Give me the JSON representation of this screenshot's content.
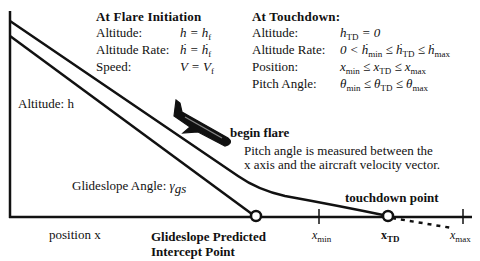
{
  "flare_initiation": {
    "title": "At Flare Initiation",
    "rows": [
      {
        "label": "Altitude:",
        "expr": "h = h",
        "sub": "f"
      },
      {
        "label": "Altitude Rate:",
        "expr": "ḣ = ḣ",
        "sub": "f"
      },
      {
        "label": "Speed:",
        "expr": "V = V",
        "sub": "f"
      }
    ]
  },
  "touchdown": {
    "title": "At Touchdown:",
    "rows": [
      {
        "label": "Altitude:",
        "expr": "h_TD = 0"
      },
      {
        "label": "Altitude Rate:",
        "expr": "0 < ḣ_min ≤ ḣ_TD ≤ ḣ_max"
      },
      {
        "label": "Position:",
        "expr": "x_min ≤ x_TD ≤ x_max"
      },
      {
        "label": "Pitch Angle:",
        "expr": "θ_min ≤ θ_TD ≤ θ_max"
      }
    ]
  },
  "labels": {
    "altitude_axis": "Altitude: h",
    "position_axis": "position x",
    "begin_flare": "begin flare",
    "pitch_note_line1": "Pitch angle is measured between the",
    "pitch_note_line2": "x axis and the aircraft velocity vector.",
    "glideslope_angle": "Glideslope Angle: ",
    "glideslope_symbol": "γ",
    "glideslope_sub": "gs",
    "intercept_line1": "Glideslope Predicted",
    "intercept_line2": "Intercept Point",
    "touchdown_point": "touchdown point",
    "x_min": "x",
    "x_min_sub": "min",
    "x_td": "x",
    "x_td_sub": "TD",
    "x_max": "x",
    "x_max_sub": "max"
  },
  "icons": {
    "aircraft": "airplane-silhouette"
  }
}
